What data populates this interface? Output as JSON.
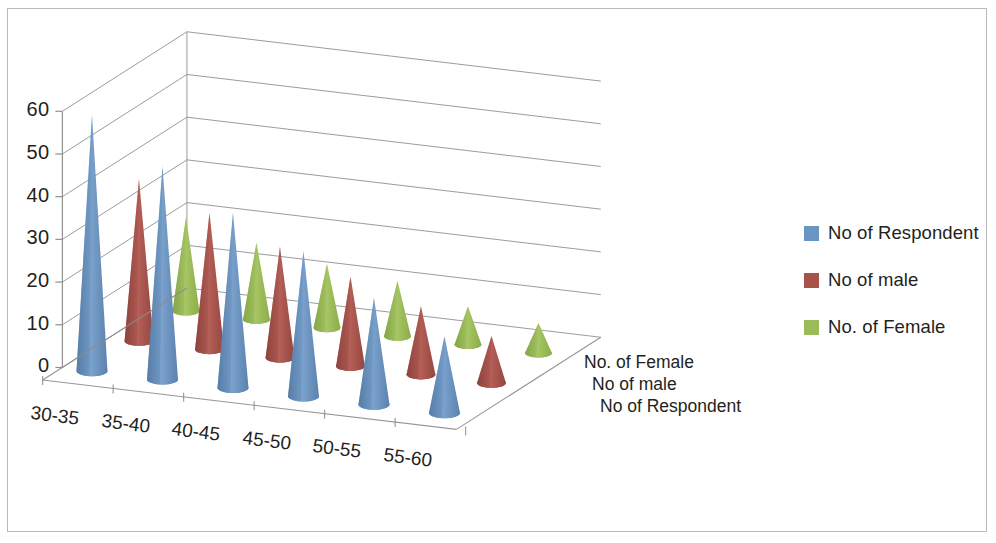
{
  "chart_data": {
    "type": "bar",
    "title": "",
    "subtitle": "",
    "xlabel": "",
    "ylabel": "",
    "zlabel": "",
    "render_style": "3d-cone-clustered",
    "categories": [
      "30-35",
      "35-40",
      "40-45",
      "45-50",
      "50-55",
      "55-60"
    ],
    "ylim": [
      0,
      60
    ],
    "yticks": [
      0,
      10,
      20,
      30,
      40,
      50,
      60
    ],
    "grid": true,
    "legend_position": "right",
    "series": [
      {
        "name": "No of Respondent",
        "color": "#6b96c4",
        "values": [
          60,
          50,
          41,
          34,
          25,
          18
        ]
      },
      {
        "name": "No of male",
        "color": "#a8524a",
        "values": [
          38,
          32,
          26,
          21,
          16,
          11
        ]
      },
      {
        "name": "No. of Female",
        "color": "#9bbb59",
        "values": [
          22,
          18,
          15,
          13,
          9,
          7
        ]
      }
    ],
    "depth_axis_labels": [
      "No. of Female",
      "No of male",
      "No of Respondent"
    ]
  },
  "legend": {
    "items": [
      {
        "label": "No of Respondent",
        "color": "#6b96c4"
      },
      {
        "label": "No of male",
        "color": "#a8524a"
      },
      {
        "label": "No. of Female",
        "color": "#9bbb59"
      }
    ]
  },
  "axes": {
    "y_tick_labels": [
      "60",
      "50",
      "40",
      "30",
      "20",
      "10",
      "0"
    ],
    "x_tick_labels": [
      "30-35",
      "35-40",
      "40-45",
      "45-50",
      "50-55",
      "55-60"
    ],
    "z_tick_labels": [
      "No. of Female",
      "No of male",
      "No of Respondent"
    ]
  },
  "colors": {
    "series_blue": "#6b96c4",
    "series_red": "#a8524a",
    "series_green": "#9bbb59",
    "gridline": "#8c8c8c",
    "frame": "#b9b9b9",
    "text": "#231f20"
  }
}
